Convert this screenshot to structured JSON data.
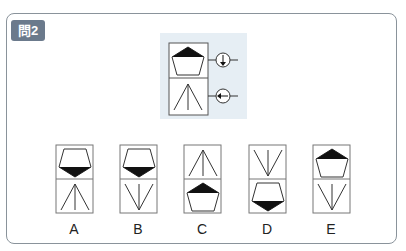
{
  "question": {
    "badge": "問2"
  },
  "stimulus": {
    "top_figure": "pentagon-top-filled",
    "bottom_figure": "arrow-fan-up",
    "top_rule": "arrow-down",
    "bottom_rule": "arrow-left"
  },
  "options": [
    {
      "label": "A",
      "top": "pentagon-bottom-filled",
      "bottom": "fan-up"
    },
    {
      "label": "B",
      "top": "pentagon-bottom-filled",
      "bottom": "fan-down"
    },
    {
      "label": "C",
      "top": "fan-up",
      "bottom": "pentagon-top-filled"
    },
    {
      "label": "D",
      "top": "fan-down",
      "bottom": "pentagon-bottom-filled"
    },
    {
      "label": "E",
      "top": "pentagon-top-filled",
      "bottom": "fan-down"
    }
  ]
}
